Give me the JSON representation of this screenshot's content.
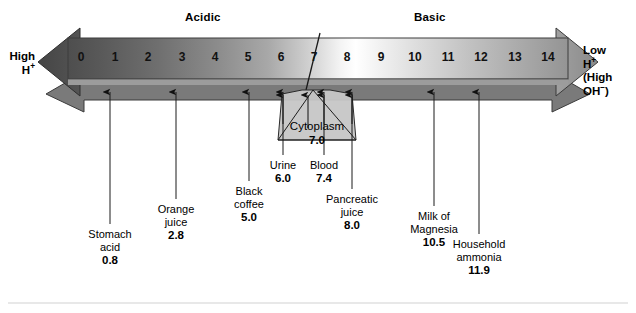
{
  "figure": {
    "headers": {
      "acidic": "Acidic",
      "basic": "Basic"
    },
    "left_cap": {
      "line1": "High",
      "line2": "H",
      "line2_sup": "+"
    },
    "right_cap": {
      "line1": "Low",
      "line2": "H",
      "line2_sup": "+",
      "line3": "(High",
      "line4": "OH",
      "line4_sup": "−",
      "line4_close": ")"
    },
    "cytoplasm": {
      "label": "Cytoplasm",
      "value": "7.0"
    },
    "divider_ph": 7
  },
  "chart_data": {
    "type": "scatter",
    "xlabel": "pH",
    "ylabel": "",
    "xlim": [
      0,
      14
    ],
    "grid": false,
    "legend": "none",
    "tick_labels": [
      "0",
      "1",
      "2",
      "3",
      "4",
      "5",
      "6",
      "7",
      "8",
      "9",
      "10",
      "11",
      "12",
      "13",
      "14"
    ],
    "tick_values": [
      0,
      1,
      2,
      3,
      4,
      5,
      6,
      7,
      8,
      9,
      10,
      11,
      12,
      13,
      14
    ],
    "annotations": [
      {
        "name": "Stomach\nacid",
        "line1": "Stomach",
        "line2": "acid",
        "value": "0.8",
        "ph": 0.8
      },
      {
        "name": "Orange\njuice",
        "line1": "Orange",
        "line2": "juice",
        "value": "2.8",
        "ph": 2.8
      },
      {
        "name": "Black\ncoffee",
        "line1": "Black",
        "line2": "coffee",
        "value": "5.0",
        "ph": 5.0
      },
      {
        "name": "Urine",
        "line1": "Urine",
        "line2": "",
        "value": "6.0",
        "ph": 6.0
      },
      {
        "name": "Cytoplasm",
        "line1": "Cytoplasm",
        "line2": "",
        "value": "7.0",
        "ph": 7.0
      },
      {
        "name": "Blood",
        "line1": "Blood",
        "line2": "",
        "value": "7.4",
        "ph": 7.4
      },
      {
        "name": "Pancreatic\njuice",
        "line1": "Pancreatic",
        "line2": "juice",
        "value": "8.0",
        "ph": 8.0
      },
      {
        "name": "Milk of\nMagnesia",
        "line1": "Milk of",
        "line2": "Magnesia",
        "value": "10.5",
        "ph": 10.5
      },
      {
        "name": "Household\nammonia",
        "line1": "Household",
        "line2": "ammonia",
        "value": "11.9",
        "ph": 11.9
      }
    ],
    "regions": [
      {
        "label": "Acidic",
        "range": [
          0,
          7
        ]
      },
      {
        "label": "Basic",
        "range": [
          7,
          14
        ]
      }
    ],
    "colors": {
      "acid_end": "#595959",
      "neutral": "#ffffff",
      "base_end": "#8f8f8f",
      "shadow": "#6e6e6e",
      "cytoplasm_fill": "#c9c9c9",
      "outline": "#1a1a1a"
    }
  },
  "ticks": [
    {
      "label": "0",
      "x": 81
    },
    {
      "label": "1",
      "x": 115
    },
    {
      "label": "2",
      "x": 148
    },
    {
      "label": "3",
      "x": 182
    },
    {
      "label": "4",
      "x": 215
    },
    {
      "label": "5",
      "x": 248
    },
    {
      "label": "6",
      "x": 281
    },
    {
      "label": "7",
      "x": 314
    },
    {
      "label": "8",
      "x": 347
    },
    {
      "label": "9",
      "x": 381
    },
    {
      "label": "10",
      "x": 415
    },
    {
      "label": "11",
      "x": 448
    },
    {
      "label": "12",
      "x": 481
    },
    {
      "label": "13",
      "x": 515
    },
    {
      "label": "14",
      "x": 548
    }
  ],
  "callouts": [
    {
      "id": "stomach-acid",
      "line1": "Stomach",
      "line2": "acid",
      "value": "0.8",
      "x": 110,
      "y": 228,
      "arrow_x": 110,
      "arrow_top": 92,
      "arrow_bottom": 224
    },
    {
      "id": "orange-juice",
      "line1": "Orange",
      "line2": "juice",
      "value": "2.8",
      "x": 176,
      "y": 203,
      "arrow_x": 176,
      "arrow_top": 92,
      "arrow_bottom": 199
    },
    {
      "id": "black-coffee",
      "line1": "Black",
      "line2": "coffee",
      "value": "5.0",
      "x": 249,
      "y": 185,
      "arrow_x": 249,
      "arrow_top": 92,
      "arrow_bottom": 181
    },
    {
      "id": "urine",
      "line1": "Urine",
      "line2": "",
      "value": "6.0",
      "x": 283,
      "y": 159,
      "arrow_x": 283,
      "arrow_top": 92,
      "arrow_bottom": 155
    },
    {
      "id": "blood",
      "line1": "Blood",
      "line2": "",
      "value": "7.4",
      "x": 324,
      "y": 159,
      "arrow_x": 324,
      "arrow_top": 92,
      "arrow_bottom": 155
    },
    {
      "id": "pancreatic-juice",
      "line1": "Pancreatic",
      "line2": "juice",
      "value": "8.0",
      "x": 352,
      "y": 193,
      "arrow_x": 352,
      "arrow_top": 92,
      "arrow_bottom": 189
    },
    {
      "id": "milk-of-magnesia",
      "line1": "Milk of",
      "line2": "Magnesia",
      "value": "10.5",
      "x": 434,
      "y": 210,
      "arrow_x": 434,
      "arrow_top": 92,
      "arrow_bottom": 206
    },
    {
      "id": "household-ammonia",
      "line1": "Household",
      "line2": "ammonia",
      "value": "11.9",
      "x": 479,
      "y": 238,
      "arrow_x": 479,
      "arrow_top": 92,
      "arrow_bottom": 234
    }
  ]
}
